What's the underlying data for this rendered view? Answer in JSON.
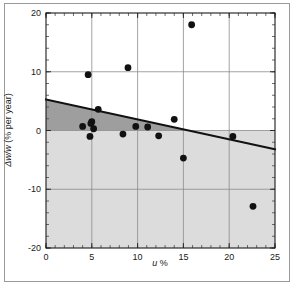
{
  "chart_data": {
    "type": "scatter",
    "title": "",
    "xlabel": "u %",
    "ylabel": "Δw/w (% per year)",
    "xlim": [
      0,
      25
    ],
    "ylim": [
      -20,
      20
    ],
    "xticks": [
      0,
      5,
      10,
      15,
      20,
      25
    ],
    "yticks": [
      20,
      10,
      0,
      -10,
      -20
    ],
    "xtick_labels": [
      "0",
      "5",
      "10",
      "15",
      "20",
      "25"
    ],
    "ytick_labels": [
      "20",
      "10",
      "0",
      "-10",
      "-20"
    ],
    "xminor_step": 1,
    "yminor_step": 2,
    "grid": true,
    "grid_color": "#8c8c8c",
    "legend": null,
    "marker_color": "#111111",
    "marker_size": 3.4,
    "points": [
      {
        "x": 4.0,
        "y": 0.7
      },
      {
        "x": 4.6,
        "y": 9.5
      },
      {
        "x": 4.8,
        "y": -1.0
      },
      {
        "x": 4.9,
        "y": 1.2
      },
      {
        "x": 5.0,
        "y": 1.5
      },
      {
        "x": 5.2,
        "y": 0.3
      },
      {
        "x": 5.7,
        "y": 3.6
      },
      {
        "x": 8.4,
        "y": -0.6
      },
      {
        "x": 8.95,
        "y": 10.7
      },
      {
        "x": 9.8,
        "y": 0.7
      },
      {
        "x": 11.1,
        "y": 0.6
      },
      {
        "x": 12.3,
        "y": -0.9
      },
      {
        "x": 14.0,
        "y": 1.9
      },
      {
        "x": 15.0,
        "y": -4.7
      },
      {
        "x": 15.9,
        "y": 18.0
      },
      {
        "x": 20.4,
        "y": -1.0
      },
      {
        "x": 22.6,
        "y": -12.9
      }
    ],
    "fit_line": {
      "name": "regression-line",
      "x_start": 0,
      "y_start": 5.3,
      "x_end": 25,
      "y_end": -3.2,
      "slope": -0.34,
      "intercept": 5.3,
      "color": "#111111",
      "width": 2.0
    },
    "shaded_regions": [
      {
        "name": "upper-band",
        "description": "dark band between y=0 and the fit line",
        "color": "#9e9e9e",
        "y_lower": 0,
        "bounded_above_by": "fit_line"
      },
      {
        "name": "lower-band",
        "description": "light band below y=0 to bottom of axes",
        "color": "#dcdcdc",
        "y_upper": 0,
        "y_lower": -20
      }
    ]
  }
}
